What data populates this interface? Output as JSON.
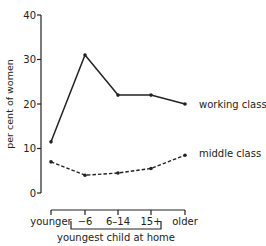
{
  "chart_data": {
    "type": "line",
    "title": "",
    "xlabel": "youngest child at home",
    "ylabel": "per cent of women",
    "categories": [
      "younger",
      "−6",
      "6–14",
      "15+",
      "older"
    ],
    "bracket_categories": [
      "−6",
      "6–14",
      "15+"
    ],
    "ylim": [
      0,
      40
    ],
    "yticks": [
      0,
      10,
      20,
      30,
      40
    ],
    "grid": false,
    "legend_position": "inline-right",
    "series": [
      {
        "name": "working class",
        "style": "solid",
        "values": [
          11.5,
          31,
          22,
          22,
          20
        ]
      },
      {
        "name": "middle class",
        "style": "dashed",
        "values": [
          7,
          4,
          4.5,
          5.5,
          8.5
        ]
      }
    ]
  },
  "colors": {
    "ink": "#222222",
    "background": "#ffffff"
  }
}
